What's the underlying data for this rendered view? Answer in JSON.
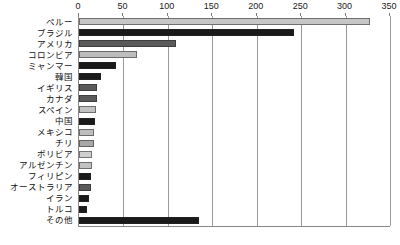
{
  "chart_data": {
    "type": "bar",
    "orientation": "horizontal",
    "title": "",
    "subtitle": "",
    "xlabel": "",
    "ylabel": "",
    "xlim": [
      0,
      350
    ],
    "ylim": null,
    "grid": true,
    "legend": null,
    "axis_position": "top",
    "tick_interval": 50,
    "tick_labels": [
      "0",
      "50",
      "100",
      "150",
      "200",
      "250",
      "300",
      "350"
    ],
    "tick_values": [
      0,
      50,
      100,
      150,
      200,
      250,
      300,
      350
    ],
    "categories": [
      "ペルー",
      "ブラジル",
      "アメリカ",
      "コロンビア",
      "ミャンマー",
      "韓国",
      "イギリス",
      "カナダ",
      "スペイン",
      "中国",
      "メキシコ",
      "チリ",
      "ボリビア",
      "アルゼンチン",
      "フィリピン",
      "オーストラリア",
      "イラン",
      "トルコ",
      "その他"
    ],
    "values": [
      328,
      242,
      109,
      65,
      42,
      25,
      20,
      20,
      19,
      18,
      17,
      17,
      15,
      15,
      14,
      14,
      11,
      9,
      135
    ],
    "bar_colors": [
      "#c6c6c6",
      "#1a1a1a",
      "#5a5a5a",
      "#bdbdbd",
      "#1a1a1a",
      "#1a1a1a",
      "#5a5a5a",
      "#5a5a5a",
      "#c2c2c2",
      "#1a1a1a",
      "#bdbdbd",
      "#a8a8a8",
      "#cfcfcf",
      "#c2c2c2",
      "#1a1a1a",
      "#5a5a5a",
      "#1a1a1a",
      "#1a1a1a",
      "#1a1a1a"
    ],
    "colors": {
      "axis": "#888888",
      "gridline": "#9a9a9a",
      "text": "#111111",
      "background": "#ffffff"
    }
  }
}
